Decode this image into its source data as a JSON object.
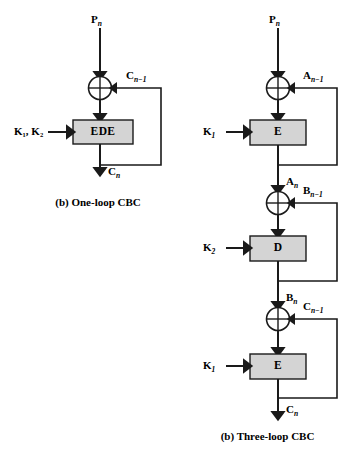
{
  "figure": {
    "background": "#ffffff",
    "line_color": "#1a1a1a",
    "box_fill": "#d4d4d4",
    "box_stroke": "#1a1a1a"
  },
  "panels": [
    {
      "id": "one-loop-cbc",
      "caption": "(b) One-loop CBC",
      "input_label": "P",
      "input_sub": "n",
      "output_label": "C",
      "output_sub": "n",
      "key_label": "K",
      "key_sub_1": "1",
      "key_sub_2": "2",
      "key_text": "K₁, K₂",
      "feedback_label": "C",
      "feedback_sub": "n−1",
      "cipher_box": "EDE",
      "xor_glyph": "⊕"
    },
    {
      "id": "three-loop-cbc",
      "caption": "(b) Three-loop CBC",
      "input_label": "P",
      "input_sub": "n",
      "output_label": "C",
      "output_sub": "n",
      "stages": [
        {
          "key_label": "K",
          "key_sub": "1",
          "box": "E",
          "feedback_label": "A",
          "feedback_sub": "n−1",
          "out_label": "A",
          "out_sub": "n"
        },
        {
          "key_label": "K",
          "key_sub": "2",
          "box": "D",
          "feedback_label": "B",
          "feedback_sub": "n−1",
          "out_label": "B",
          "out_sub": "n"
        },
        {
          "key_label": "K",
          "key_sub": "1",
          "box": "E",
          "feedback_label": "C",
          "feedback_sub": "n−1",
          "out_label": "C",
          "out_sub": "n"
        }
      ]
    }
  ]
}
